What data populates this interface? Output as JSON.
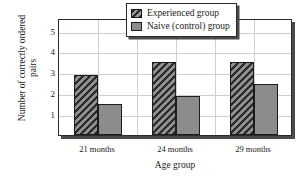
{
  "chart_data": {
    "type": "bar",
    "title": "",
    "xlabel": "Age group",
    "ylabel": "Number of correctly ordered pairs",
    "categories": [
      "21 months",
      "24 months",
      "29 months"
    ],
    "series": [
      {
        "name": "Experienced group",
        "values": [
          2.85,
          3.5,
          3.5
        ],
        "pattern": "diagonal-hatch",
        "color": "#4e4e4e"
      },
      {
        "name": "Naive (control) group",
        "values": [
          1.5,
          1.85,
          2.45
        ],
        "pattern": "solid",
        "color": "#8c8c8c"
      }
    ],
    "yticks": [
      1,
      2,
      3,
      4,
      5
    ],
    "ylim": [
      0,
      5.6
    ],
    "grid": true,
    "legend_position": "top-right-inside"
  },
  "axes": {
    "y_title": "Number of correctly ordered pairs",
    "x_title": "Age group",
    "y_tick_labels": [
      "5",
      "4",
      "3",
      "2",
      "1"
    ],
    "x_tick_labels": [
      "21 months",
      "24 months",
      "29 months"
    ]
  },
  "legend": {
    "entries": [
      {
        "label": "Experienced group",
        "swatch": "hatched-swatch"
      },
      {
        "label": "Naive (control) group",
        "swatch": "gray-swatch"
      }
    ]
  }
}
